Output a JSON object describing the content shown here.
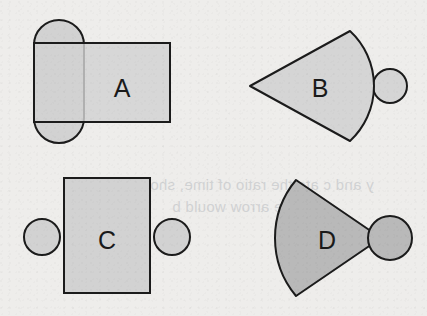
{
  "figure": {
    "background_color": "#eeedeb",
    "stroke_color": "#1b1b1b",
    "label_color": "#1a1a1a",
    "shapes": [
      {
        "id": "shape-a",
        "label": "A",
        "label_x": 122,
        "label_y": 88,
        "description": "rectangle overlapped on its left side by a vertical capsule (stadium) shape",
        "fill": "#d2d2d2",
        "parts": [
          {
            "part": "capsule",
            "x": 34,
            "y": 20,
            "width": 50,
            "height": 123,
            "corner_radius": 25
          },
          {
            "part": "rectangle",
            "x": 34,
            "y": 43,
            "width": 136,
            "height": 79
          }
        ]
      },
      {
        "id": "shape-b",
        "label": "B",
        "label_x": 320,
        "label_y": 88,
        "description": "circular sector wedge with apex at left and a small circle tangent to its right arc",
        "fill": "#d5d5d5",
        "parts": [
          {
            "part": "wedge",
            "apex_x": 250,
            "apex_y": 86,
            "arc_top_x": 350,
            "arc_top_y": 31,
            "arc_bottom_x": 350,
            "arc_bottom_y": 141,
            "arc_bulge_x": 374
          },
          {
            "part": "circle",
            "cx": 390,
            "cy": 86,
            "r": 17
          }
        ]
      },
      {
        "id": "shape-c",
        "label": "C",
        "label_x": 107,
        "label_y": 240,
        "description": "rectangle with one circle attached on the left side and one circle on the right side",
        "fill": "#d2d2d2",
        "parts": [
          {
            "part": "rectangle",
            "x": 64,
            "y": 178,
            "width": 86,
            "height": 115
          },
          {
            "part": "circle-left",
            "cx": 42,
            "cy": 237,
            "r": 18
          },
          {
            "part": "circle-right",
            "cx": 172,
            "cy": 237,
            "r": 18
          }
        ]
      },
      {
        "id": "shape-d",
        "label": "D",
        "label_x": 327,
        "label_y": 240,
        "description": "circular sector wedge with arc at left and apex at right, with a circle at the right apex",
        "fill": "#b9b9b9",
        "parts": [
          {
            "part": "wedge",
            "apex_x": 381,
            "apex_y": 238,
            "arc_top_x": 296,
            "arc_top_y": 180,
            "arc_bottom_x": 296,
            "arc_bottom_y": 296,
            "arc_bulge_x": 275
          },
          {
            "part": "circle",
            "cx": 390,
            "cy": 238,
            "r": 22
          }
        ]
      }
    ],
    "ghost_text": {
      "line_1": "y and c    ate the ratio of time, sho",
      "line_2": "e arrow would b"
    }
  }
}
